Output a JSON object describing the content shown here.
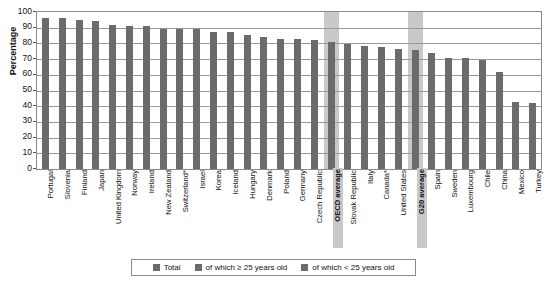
{
  "chart_data": {
    "type": "bar",
    "title": "",
    "xlabel": "",
    "ylabel": "Percentage",
    "ylim": [
      0,
      100
    ],
    "yticks": [
      0,
      10,
      20,
      30,
      40,
      50,
      60,
      70,
      80,
      90,
      100
    ],
    "grid": true,
    "legend_position": "bottom",
    "categories": [
      "Portugal",
      "Slovenia",
      "Finland",
      "Japan",
      "United Kingdom",
      "Norway",
      "Ireland",
      "New Zealand",
      "Switzerland*",
      "Israel",
      "Korea",
      "Iceland",
      "Hungary",
      "Denmark",
      "Poland",
      "Germany",
      "Czech Republic",
      "OECD average",
      "Slovak Republic",
      "Italy",
      "Canada*",
      "United States",
      "G20 average",
      "Spain",
      "Sweden",
      "Luxembourg",
      "Chile",
      "China",
      "Mexico",
      "Turkey"
    ],
    "highlighted_categories": [
      "OECD average",
      "G20 average"
    ],
    "series": [
      {
        "name": "Total",
        "values": [
          96,
          96,
          95,
          94.5,
          92,
          91,
          91,
          89.5,
          89.5,
          89.5,
          87.5,
          87,
          85.5,
          84,
          83,
          82.5,
          82,
          81,
          79.5,
          78.5,
          77.5,
          76.5,
          75.5,
          74,
          71,
          70.5,
          69.5,
          62,
          42.5,
          42
        ]
      }
    ],
    "legend": [
      {
        "label": "Total",
        "color": "#6b6b6b"
      },
      {
        "label": "of which ≥ 25 years old",
        "color": "#6b6b6b"
      },
      {
        "label": "of which < 25 years old",
        "color": "#6b6b6b"
      }
    ],
    "colors": {
      "bar": "#6b6b6b",
      "highlight_band": "#c9c9c9",
      "gridline": "#9a9a9a",
      "axis": "#8a8a8a"
    }
  }
}
